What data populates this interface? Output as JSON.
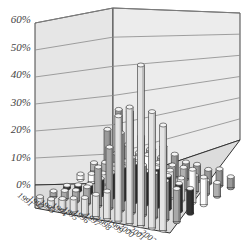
{
  "chart_data": {
    "type": "bar",
    "subtype": "3d-cylinder",
    "title": "",
    "xlabel": "",
    "ylabel": "",
    "ylim": [
      0,
      60
    ],
    "yticks": [
      "0%",
      "10%",
      "20%",
      "30%",
      "40%",
      "50%",
      "60%"
    ],
    "categories": [
      "1991",
      "1992",
      "1993",
      "1994",
      "1995",
      "1996",
      "1997",
      "1998",
      "1999",
      "2000",
      "2001",
      "2002"
    ],
    "grid": true,
    "legend": "none",
    "series": [
      {
        "name": "Series A",
        "color": "#9a9a9a",
        "values": [
          12,
          20,
          20,
          12,
          8,
          10,
          8,
          6,
          6,
          5,
          6,
          4
        ]
      },
      {
        "name": "Series B",
        "color": "#b0b0b0",
        "values": [
          3,
          4,
          8,
          12,
          10,
          12,
          10,
          8,
          8,
          6,
          5,
          5
        ]
      },
      {
        "name": "Series C",
        "color": "#ffffff",
        "values": [
          2,
          3,
          4,
          8,
          10,
          12,
          14,
          12,
          10,
          8,
          12,
          10
        ]
      },
      {
        "name": "Series D",
        "color": "#333333",
        "values": [
          1,
          2,
          3,
          6,
          9,
          12,
          14,
          12,
          14,
          12,
          10,
          9
        ]
      },
      {
        "name": "Series E",
        "color": "#a8a8a8",
        "values": [
          2,
          3,
          4,
          6,
          14,
          22,
          28,
          20,
          18,
          16,
          14,
          12
        ]
      },
      {
        "name": "Series F",
        "color": "#e4e4e4",
        "values": [
          3,
          3,
          4,
          5,
          6,
          8,
          10,
          38,
          42,
          58,
          42,
          38
        ]
      }
    ]
  }
}
